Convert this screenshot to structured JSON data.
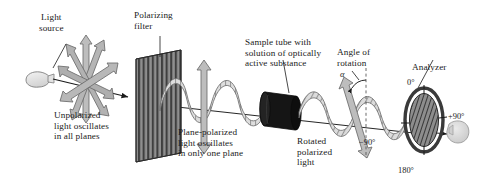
{
  "figure": {
    "background": "#ffffff",
    "ink": "#1a1a1a"
  },
  "labels": {
    "light_source": "Light\nsource",
    "polarizing_filter": "Polarizing\nfilter",
    "sample_tube": "Sample tube with\nsolution of optically\nactive substance",
    "angle_of_rotation": "Angle of\nrotation",
    "analyzer": "Analyzer",
    "unpolarized": "Unpolarized\nlight oscillates\nin all planes",
    "plane_polarized": "Plane-polarized\nlight oscillates\nin only one plane",
    "rotated": "Rotated\npolarized\nlight",
    "alpha_symbol": "α"
  },
  "analyzer_dial": {
    "top": "0°",
    "right": "+90°",
    "left": "−90°",
    "bottom": "180°"
  },
  "colors": {
    "filter_dark": "#4a4a4a",
    "filter_light": "#9a9a9a",
    "tube_dark": "#121212",
    "tube_mid": "#2b2b2b",
    "wave_fill": "#d8d8d8",
    "wave_stroke": "#6e6e6e",
    "arrow_fill": "#b9b9b9",
    "arrow_stroke": "#6a6a6a",
    "bulb_fill": "#e9e9e9",
    "ring_dark": "#3a3a3a",
    "disc_fill": "#8e8e8e",
    "eye_fill": "#d9d9d9",
    "beam": "#1a1a1a"
  }
}
